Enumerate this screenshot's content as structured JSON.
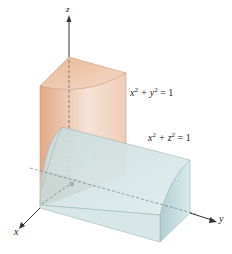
{
  "figure": {
    "header_fragment": "igure",
    "axes": {
      "x": "x",
      "y": "y",
      "z": "z"
    },
    "equations": [
      {
        "lhs_a": "x",
        "lhs_b": "y",
        "exp": "2",
        "rhs": "= 1"
      },
      {
        "lhs_a": "x",
        "lhs_b": "z",
        "exp": "2",
        "rhs": "= 1"
      }
    ],
    "origin_label": "0",
    "colors": {
      "cylinder_xy": "#e8b99a",
      "cylinder_xz": "#b9d3d6"
    }
  }
}
